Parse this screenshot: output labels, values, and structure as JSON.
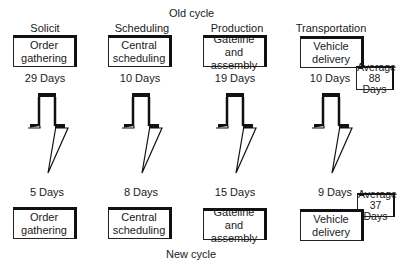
{
  "old_cycle": {
    "title": "Old cycle",
    "stages": [
      {
        "category": "Solicit",
        "box": "Order gathering",
        "days": "29 Days"
      },
      {
        "category": "Scheduling",
        "box": "Central scheduling",
        "days": "10 Days"
      },
      {
        "category": "Production",
        "box": "Gateline and assembly",
        "days": "19 Days"
      },
      {
        "category": "Transportation",
        "box": "Vehicle delivery",
        "days": "10 Days"
      }
    ],
    "average": {
      "line1": "Average",
      "line2": "88 Days"
    }
  },
  "new_cycle": {
    "title": "New cycle",
    "stages": [
      {
        "box": "Order gathering",
        "days": "5 Days"
      },
      {
        "box": "Central scheduling",
        "days": "8 Days"
      },
      {
        "box": "Gateline and assembly",
        "days": "15 Days"
      },
      {
        "box": "Vehicle delivery",
        "days": "9 Days"
      }
    ],
    "average": {
      "line1": "Average",
      "line2": "37 Days"
    }
  }
}
